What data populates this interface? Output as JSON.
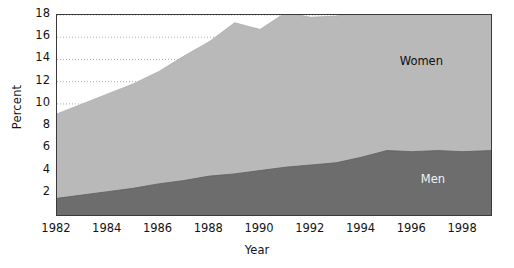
{
  "chart_data": {
    "type": "area",
    "stacked": true,
    "title": "",
    "xlabel": "Year",
    "ylabel": "Percent",
    "xlim": [
      1982,
      1999.1
    ],
    "ylim": [
      0,
      18
    ],
    "grid": true,
    "grid_style": "dotted horizontal",
    "legend_position": "in-plot annotations",
    "x_ticks": [
      1982,
      1984,
      1986,
      1988,
      1990,
      1992,
      1994,
      1996,
      1998
    ],
    "y_ticks": [
      2,
      4,
      6,
      8,
      10,
      12,
      14,
      16,
      18
    ],
    "x": [
      1982,
      1983,
      1984,
      1985,
      1986,
      1987,
      1988,
      1989,
      1990,
      1991,
      1992,
      1993,
      1994,
      1995,
      1996,
      1997,
      1998,
      1999.1
    ],
    "series": [
      {
        "name": "Men",
        "color": "#6d6d6d",
        "values": [
          1.5,
          1.8,
          2.1,
          2.4,
          2.8,
          3.1,
          3.5,
          3.7,
          4.0,
          4.3,
          4.5,
          4.7,
          5.2,
          5.8,
          5.7,
          5.8,
          5.7,
          5.8
        ]
      },
      {
        "name": "Women",
        "color": "#b9b9b9",
        "values": [
          7.6,
          8.2,
          8.8,
          9.4,
          10.1,
          11.2,
          12.1,
          13.6,
          12.7,
          13.9,
          13.3,
          13.2,
          13.1,
          13.5,
          13.0,
          13.4,
          14.2,
          15.4
        ]
      }
    ],
    "annotations": [
      {
        "text": "Women",
        "x": 1997.0,
        "y": 13.9
      },
      {
        "text": "Men",
        "x": 1997.2,
        "y": 3.2
      }
    ]
  }
}
